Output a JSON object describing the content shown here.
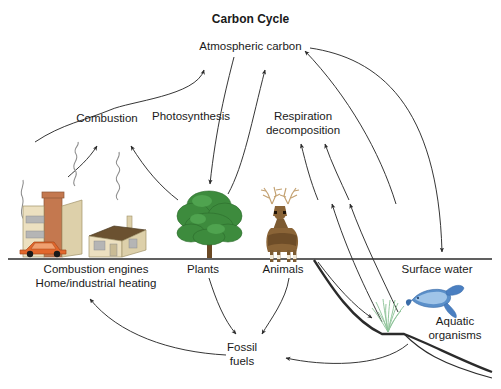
{
  "diagram": {
    "title": "Carbon Cycle",
    "type": "cycle-diagram",
    "background_color": "#ffffff",
    "line_color": "#2b2b2b",
    "text_color": "#1a1a1a",
    "labels": {
      "atmospheric_carbon": "Atmospheric carbon",
      "combustion": "Combustion",
      "photosynthesis": "Photosynthesis",
      "respiration_decomposition": "Respiration\ndecomposition",
      "combustion_engines": "Combustion engines\nHome/industrial heating",
      "plants": "Plants",
      "animals": "Animals",
      "surface_water": "Surface water",
      "aquatic_organisms": "Aquatic\norganisms",
      "fossil_fuels": "Fossil\nfuels"
    },
    "reservoirs": [
      "Atmospheric carbon",
      "Combustion engines Home/industrial heating",
      "Plants",
      "Animals",
      "Surface water",
      "Aquatic organisms",
      "Fossil fuels"
    ],
    "processes": [
      "Combustion",
      "Photosynthesis",
      "Respiration decomposition"
    ],
    "flows": [
      {
        "from": "Combustion engines",
        "to": "Atmospheric carbon",
        "via": "Combustion"
      },
      {
        "from": "Fossil fuels",
        "to": "Combustion engines",
        "via": ""
      },
      {
        "from": "Atmospheric carbon",
        "to": "Plants",
        "via": "Photosynthesis"
      },
      {
        "from": "Plants",
        "to": "Atmospheric carbon",
        "via": "Respiration decomposition"
      },
      {
        "from": "Animals",
        "to": "Atmospheric carbon",
        "via": "Respiration decomposition"
      },
      {
        "from": "Plants",
        "to": "Fossil fuels",
        "via": ""
      },
      {
        "from": "Animals",
        "to": "Fossil fuels",
        "via": ""
      },
      {
        "from": "Atmospheric carbon",
        "to": "Surface water",
        "via": ""
      },
      {
        "from": "Surface water",
        "to": "Atmospheric carbon",
        "via": ""
      },
      {
        "from": "Surface water",
        "to": "Aquatic organisms",
        "via": ""
      },
      {
        "from": "Aquatic organisms",
        "to": "Atmospheric carbon",
        "via": "Respiration decomposition"
      },
      {
        "from": "Aquatic organisms",
        "to": "Fossil fuels",
        "via": ""
      }
    ],
    "illustrations": {
      "factory": {
        "name": "factory-illustration",
        "body_color": "#ece0c0",
        "stack_color": "#c4784f",
        "window_color": "#b5b5b5"
      },
      "car": {
        "name": "car-illustration",
        "body_color": "#e2672c",
        "wheel_color": "#1a1a1a"
      },
      "house": {
        "name": "house-illustration",
        "wall_color": "#ece0c0",
        "roof_color": "#6b5130"
      },
      "tree": {
        "name": "tree-illustration",
        "foliage_color": "#3d8b3d",
        "trunk_color": "#6b4a25"
      },
      "deer": {
        "name": "deer-illustration",
        "body_color": "#8a6437",
        "antler_color": "#c3a171"
      },
      "fish": {
        "name": "fish-illustration",
        "body_color": "#4a7fc1",
        "accent_color": "#9fc4e8"
      },
      "seaweed": {
        "name": "seaweed-illustration",
        "color": "#8fc49a"
      },
      "smoke": {
        "name": "smoke-illustration",
        "color": "#8d8d8d"
      }
    }
  }
}
